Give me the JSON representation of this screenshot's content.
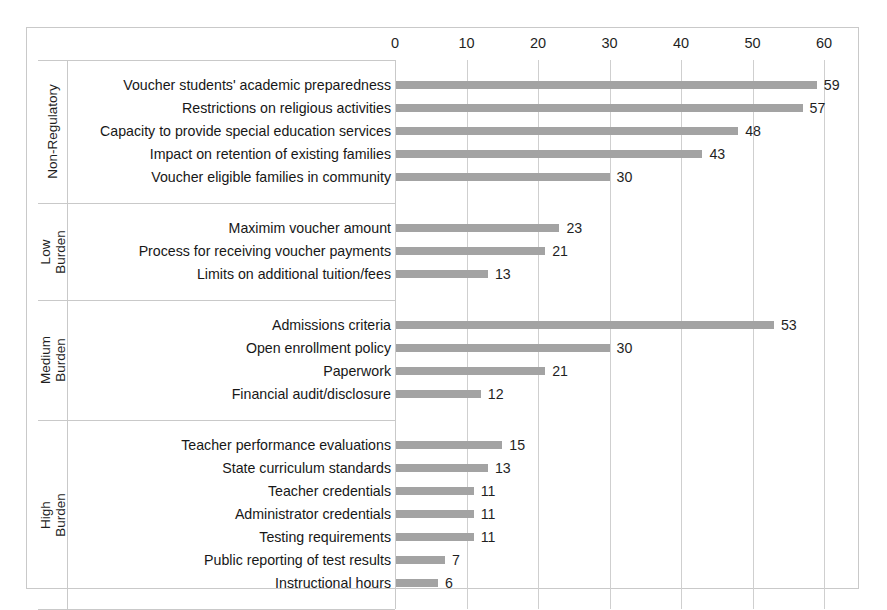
{
  "chart_data": {
    "type": "bar",
    "orientation": "horizontal",
    "title": "",
    "xlabel": "",
    "ylabel": "",
    "xlim": [
      0,
      60
    ],
    "xticks": [
      0,
      10,
      20,
      30,
      40,
      50,
      60
    ],
    "xtick_labels": [
      "0",
      "10",
      "20",
      "30",
      "40",
      "50",
      "60"
    ],
    "grid": "vertical",
    "legend": "none",
    "bar_color": "#a3a3a3",
    "value_labels": true,
    "groups": [
      {
        "name": "Non-Regulatory",
        "categories": [
          "Voucher students' academic preparedness",
          "Restrictions on religious activities",
          "Capacity to provide special education services",
          "Impact on retention of existing families",
          "Voucher eligible families in community"
        ],
        "values": [
          59,
          57,
          48,
          43,
          30
        ]
      },
      {
        "name": "Low\nBurden",
        "categories": [
          "Maximim voucher amount",
          "Process for receiving voucher payments",
          "Limits on additional tuition/fees"
        ],
        "values": [
          23,
          21,
          13
        ]
      },
      {
        "name": "Medium\nBurden",
        "categories": [
          "Admissions criteria",
          "Open enrollment policy",
          "Paperwork",
          "Financial audit/disclosure"
        ],
        "values": [
          53,
          30,
          21,
          12
        ]
      },
      {
        "name": "High\nBurden",
        "categories": [
          "Teacher performance evaluations",
          "State curriculum standards",
          "Teacher credentials",
          "Administrator credentials",
          "Testing requirements",
          "Public reporting of test results",
          "Instructional hours"
        ],
        "values": [
          15,
          13,
          11,
          11,
          11,
          7,
          6
        ]
      }
    ]
  }
}
